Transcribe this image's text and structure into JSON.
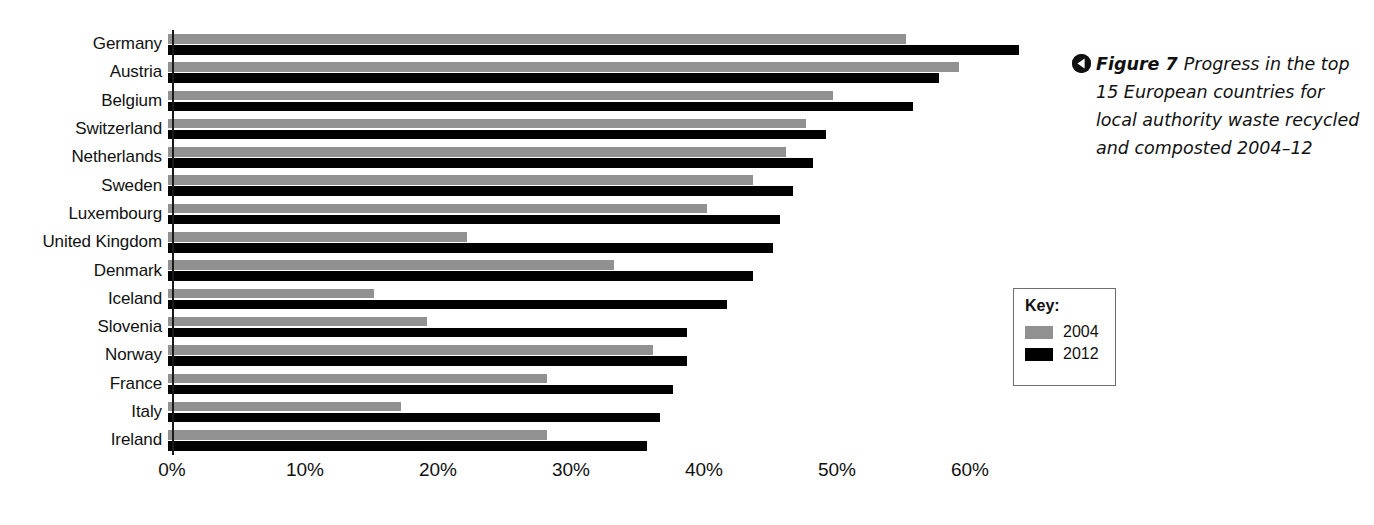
{
  "figure": {
    "marker_icon": "left-triangle-icon",
    "label": "Figure 7",
    "caption": "Progress in the top 15 European countries for local authority waste recycled and composted 2004–12"
  },
  "key": {
    "title": "Key:",
    "entries": [
      {
        "label": "2004",
        "color": "#919191"
      },
      {
        "label": "2012",
        "color": "#010101"
      }
    ]
  },
  "chart_data": {
    "type": "bar",
    "orientation": "horizontal",
    "title": "Progress in the top 15 European countries for local authority waste recycled and composted 2004–12",
    "xlabel": "",
    "ylabel": "",
    "xlim": [
      0,
      65
    ],
    "xticks": [
      0,
      10,
      20,
      30,
      40,
      50,
      60
    ],
    "xtick_labels": [
      "0%",
      "10%",
      "20%",
      "30%",
      "40%",
      "50%",
      "60%"
    ],
    "grid": false,
    "legend_position": "right",
    "categories": [
      "Germany",
      "Austria",
      "Belgium",
      "Switzerland",
      "Netherlands",
      "Sweden",
      "Luxembourg",
      "United Kingdom",
      "Denmark",
      "Iceland",
      "Slovenia",
      "Norway",
      "France",
      "Italy",
      "Ireland"
    ],
    "series": [
      {
        "name": "2004",
        "color": "#919191",
        "values": [
          55.5,
          59.5,
          50.0,
          48.0,
          46.5,
          44.0,
          40.5,
          22.5,
          33.5,
          15.5,
          19.5,
          36.5,
          28.5,
          17.5,
          28.5
        ]
      },
      {
        "name": "2012",
        "color": "#010101",
        "values": [
          64.0,
          58.0,
          56.0,
          49.5,
          48.5,
          47.0,
          46.0,
          45.5,
          44.0,
          42.0,
          39.0,
          39.0,
          38.0,
          37.0,
          36.0
        ]
      }
    ]
  }
}
